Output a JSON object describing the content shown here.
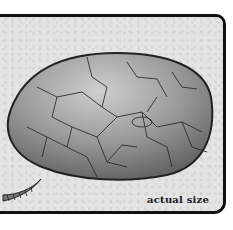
{
  "illustration": {
    "subject": "fossil egg",
    "caption": "actual size",
    "icon": "egg-illustration",
    "secondary": "claw-illustration"
  },
  "colors": {
    "frame_border": "#111111",
    "background": "#e4e4e4",
    "egg_light": "#bdbdbd",
    "egg_dark": "#5e5e5e"
  }
}
